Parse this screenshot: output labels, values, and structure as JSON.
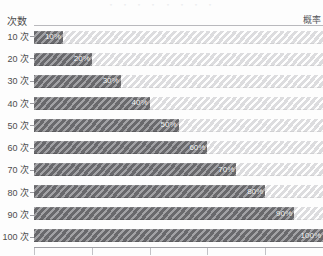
{
  "top_cropped_text": "・ ・ ・ ・ ・ ・ ・ ・",
  "axes": {
    "y_title": "次数",
    "x_title": "概率"
  },
  "chart_data": {
    "type": "bar",
    "orientation": "horizontal",
    "title": "",
    "subtitle": "",
    "xlabel": "概率",
    "ylabel": "次数",
    "categories": [
      "10 次",
      "20 次",
      "30 次",
      "40 次",
      "50 次",
      "60 次",
      "70 次",
      "80 次",
      "90 次",
      "100 次"
    ],
    "values": [
      10,
      20,
      30,
      40,
      50,
      60,
      70,
      80,
      90,
      100
    ],
    "data_labels": [
      "10%",
      "20%",
      "30%",
      "40%",
      "50%",
      "60%",
      "70%",
      "80%",
      "90%",
      "100%"
    ],
    "remainders": [
      90,
      80,
      70,
      60,
      50,
      40,
      30,
      20,
      10,
      0
    ],
    "xlim": [
      0,
      100
    ],
    "x_tick_values": [
      0,
      20,
      40,
      60,
      80,
      100
    ],
    "x_tick_labels": [
      "",
      "",
      "",
      "",
      "",
      ""
    ],
    "grid": false,
    "legend": "none",
    "stacked": true,
    "series": [
      {
        "name": "概率",
        "values": [
          10,
          20,
          30,
          40,
          50,
          60,
          70,
          80,
          90,
          100
        ],
        "color": "#7a7a7e",
        "hatch": "diagonal-stripes"
      },
      {
        "name": "剩余",
        "values": [
          90,
          80,
          70,
          60,
          50,
          40,
          30,
          20,
          10,
          0
        ],
        "color": "#f0f0f1",
        "hatch": "diagonal-stripes-light"
      }
    ]
  },
  "colors": {
    "bar_fill": "#7a7a7e",
    "bar_rest": "#f0f0f1",
    "label_text": "#ffffff",
    "axis_text": "#4d4d4d",
    "axis_line": "#9f9fa4",
    "background": "#fdfdfd"
  }
}
